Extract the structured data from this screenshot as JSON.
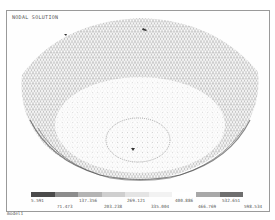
{
  "plot": {
    "title": "NODAL SOLUTION",
    "footer_label": "model1"
  },
  "legend": {
    "colors": [
      "#4a4a4a",
      "#8c8c8c",
      "#b4b4b4",
      "#cfcfcf",
      "#e4e4e4",
      "#f2f2f2",
      "#ffffff",
      "#a8a8a8",
      "#6e6e6e"
    ],
    "upper_labels": [
      "5.591",
      "137.356",
      "269.121",
      "400.886",
      "532.651"
    ],
    "lower_labels": [
      "71.473",
      "203.238",
      "335.004",
      "466.769",
      "598.534"
    ]
  }
}
